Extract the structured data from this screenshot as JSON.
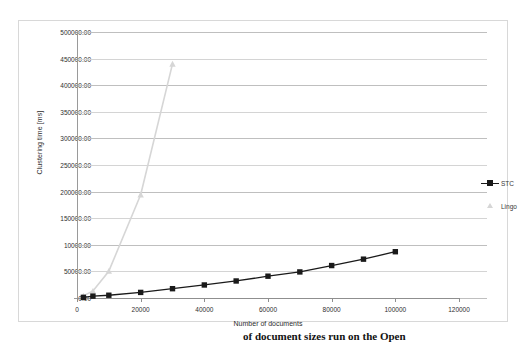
{
  "chart_data": {
    "type": "line",
    "title": "",
    "xlabel": "Number of documents",
    "ylabel": "Clustering time [ms]",
    "xlim": [
      0,
      120000
    ],
    "ylim": [
      0,
      500000
    ],
    "grid": "horizontal",
    "legend_position": "right",
    "x_ticks": [
      0,
      20000,
      40000,
      60000,
      80000,
      100000,
      120000
    ],
    "x_tick_labels": [
      "0",
      "20000",
      "40000",
      "60000",
      "80000",
      "100000",
      "120000"
    ],
    "y_ticks": [
      0,
      50000,
      100000,
      150000,
      200000,
      250000,
      300000,
      350000,
      400000,
      450000,
      500000
    ],
    "y_tick_labels": [
      "0.00",
      "50000.00",
      "10000.00",
      "150000.00",
      "200000.00",
      "250000.00",
      "300000.00",
      "350000.00",
      "400000.00",
      "450000.00",
      "500000.00"
    ],
    "series": [
      {
        "name": "STC",
        "color": "#1a1a1a",
        "marker": "square",
        "x": [
          2000,
          5000,
          10000,
          20000,
          30000,
          40000,
          50000,
          60000,
          70000,
          80000,
          90000,
          100000
        ],
        "y": [
          1200,
          3500,
          5200,
          10500,
          17500,
          24500,
          32000,
          41000,
          49000,
          61000,
          73000,
          87000
        ]
      },
      {
        "name": "Lingo",
        "color": "#d6d6d6",
        "marker": "triangle",
        "x": [
          2000,
          5000,
          10000,
          20000,
          30000
        ],
        "y": [
          4000,
          13000,
          50500,
          194000,
          440000
        ]
      }
    ]
  },
  "legend": {
    "items": [
      {
        "label": "STC",
        "color": "#1a1a1a",
        "marker": "square"
      },
      {
        "label": "Lingo",
        "color": "#d6d6d6",
        "marker": "triangle"
      }
    ]
  },
  "axes": {
    "x_title": "Number of documents",
    "y_title": "Clustering time [ms]"
  },
  "caption": {
    "text": "of document sizes run on the Open"
  },
  "colors": {
    "stc": "#1a1a1a",
    "lingo": "#d6d6d6",
    "gridline": "#bfbfbf",
    "axis": "#8f8f8f",
    "frame": "#d8d8d8",
    "background": "#ffffff"
  }
}
